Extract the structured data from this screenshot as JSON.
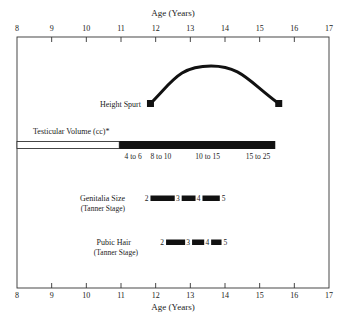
{
  "axis": {
    "title_top": "Age (Years)",
    "title_bottom": "Age (Years)",
    "min": 8,
    "max": 17,
    "ticks": [
      "8",
      "9",
      "10",
      "11",
      "12",
      "13",
      "14",
      "15",
      "16",
      "17"
    ]
  },
  "height_spurt": {
    "label": "Height Spurt",
    "start_age": 11.85,
    "peak_age": 13.6,
    "end_age": 15.55
  },
  "testicular_volume": {
    "label": "Testicular Volume (cc)*",
    "open_start_age": 8,
    "solid_start_age": 10.95,
    "solid_end_age": 15.45,
    "annotations": [
      {
        "text": "4 to 6",
        "age": 11.35
      },
      {
        "text": "8 to 10",
        "age": 12.15
      },
      {
        "text": "10 to 15",
        "age": 13.5
      },
      {
        "text": "15 to 25",
        "age": 14.95
      }
    ]
  },
  "genitalia": {
    "label": "Genitalia Size",
    "sublabel": "(Tanner Stage)",
    "stages": [
      {
        "stage": "2",
        "from": 11.85,
        "to": 12.55
      },
      {
        "stage": "3",
        "from": 12.75,
        "to": 13.15
      },
      {
        "stage": "4",
        "from": 13.35,
        "to": 13.85
      },
      {
        "stage": "5"
      }
    ]
  },
  "pubic_hair": {
    "label": "Pubic Hair",
    "sublabel": "(Tanner Stage)",
    "stages": [
      {
        "stage": "2",
        "from": 12.3,
        "to": 12.85
      },
      {
        "stage": "3",
        "from": 13.05,
        "to": 13.4
      },
      {
        "stage": "4",
        "from": 13.6,
        "to": 13.9
      },
      {
        "stage": "5"
      }
    ]
  }
}
